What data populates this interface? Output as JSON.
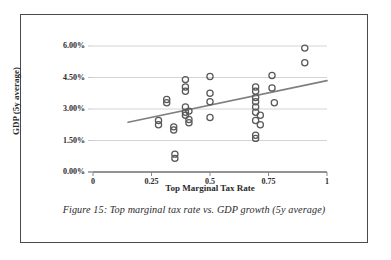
{
  "figure": {
    "caption": "Figure 15: Top marginal tax rate vs. GDP growth (5y average)"
  },
  "chart_data": {
    "type": "scatter",
    "title": "",
    "xlabel": "Top Marginal Tax Rate",
    "ylabel": "GDP (5y average)",
    "xlim": [
      0,
      1
    ],
    "ylim": [
      0,
      0.06
    ],
    "xticks": [
      0,
      0.25,
      0.5,
      0.75,
      1
    ],
    "xtick_labels": [
      "0",
      "0.25",
      "0.5",
      "0.75",
      "1"
    ],
    "yticks": [
      0,
      0.015,
      0.03,
      0.045,
      0.06
    ],
    "ytick_labels": [
      "0.00%",
      "1.50%",
      "3.00%",
      "4.50%",
      "6.00%"
    ],
    "grid": "horizontal",
    "legend": "none",
    "marker": "open-circle",
    "marker_color": "#595959",
    "points": [
      {
        "x": 0.28,
        "y": 0.0245
      },
      {
        "x": 0.28,
        "y": 0.0225
      },
      {
        "x": 0.315,
        "y": 0.0345
      },
      {
        "x": 0.315,
        "y": 0.033
      },
      {
        "x": 0.345,
        "y": 0.0215
      },
      {
        "x": 0.345,
        "y": 0.02
      },
      {
        "x": 0.35,
        "y": 0.0085
      },
      {
        "x": 0.35,
        "y": 0.0065
      },
      {
        "x": 0.395,
        "y": 0.044
      },
      {
        "x": 0.395,
        "y": 0.0405
      },
      {
        "x": 0.395,
        "y": 0.0385
      },
      {
        "x": 0.395,
        "y": 0.031
      },
      {
        "x": 0.395,
        "y": 0.0285
      },
      {
        "x": 0.395,
        "y": 0.027
      },
      {
        "x": 0.41,
        "y": 0.029
      },
      {
        "x": 0.41,
        "y": 0.025
      },
      {
        "x": 0.41,
        "y": 0.0235
      },
      {
        "x": 0.5,
        "y": 0.0455
      },
      {
        "x": 0.5,
        "y": 0.0375
      },
      {
        "x": 0.5,
        "y": 0.0335
      },
      {
        "x": 0.5,
        "y": 0.026
      },
      {
        "x": 0.695,
        "y": 0.0405
      },
      {
        "x": 0.695,
        "y": 0.0385
      },
      {
        "x": 0.695,
        "y": 0.0355
      },
      {
        "x": 0.695,
        "y": 0.0335
      },
      {
        "x": 0.695,
        "y": 0.031
      },
      {
        "x": 0.695,
        "y": 0.0285
      },
      {
        "x": 0.695,
        "y": 0.0245
      },
      {
        "x": 0.695,
        "y": 0.0175
      },
      {
        "x": 0.695,
        "y": 0.016
      },
      {
        "x": 0.715,
        "y": 0.027
      },
      {
        "x": 0.715,
        "y": 0.0225
      },
      {
        "x": 0.765,
        "y": 0.046
      },
      {
        "x": 0.765,
        "y": 0.04
      },
      {
        "x": 0.775,
        "y": 0.033
      },
      {
        "x": 0.905,
        "y": 0.059
      },
      {
        "x": 0.905,
        "y": 0.052
      }
    ],
    "trendline": {
      "x0": 0.15,
      "y0": 0.0237,
      "x1": 1.0,
      "y1": 0.0435,
      "color": "#7f7f7f"
    }
  }
}
